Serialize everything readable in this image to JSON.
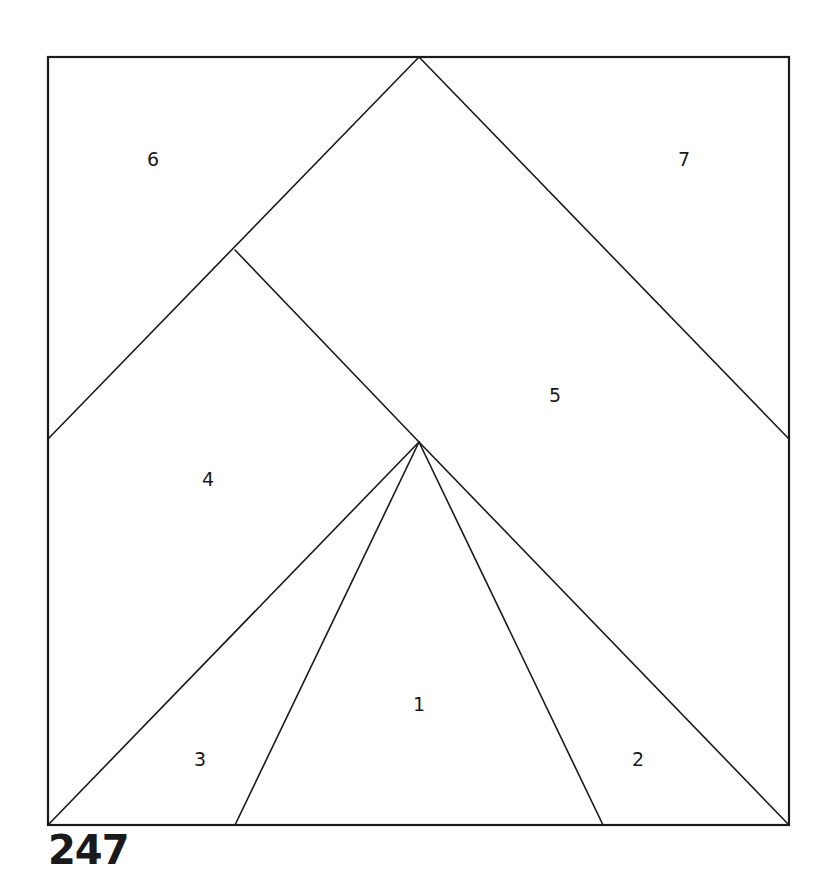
{
  "block": {
    "number": "247",
    "outline": {
      "x1": 48,
      "y1": 57,
      "x2": 789,
      "y2": 825
    }
  },
  "vertices": {
    "apex": [
      419,
      57
    ],
    "center": [
      419,
      442
    ],
    "left_mid": [
      48,
      439
    ],
    "right_mid": [
      789,
      439
    ],
    "left_junction": [
      235,
      250
    ],
    "bottom_left": [
      48,
      825
    ],
    "bottom_right": [
      789,
      825
    ],
    "bottom_inner_left": [
      235,
      825
    ],
    "bottom_inner_right": [
      603,
      825
    ]
  },
  "sections": [
    {
      "id": "1",
      "label": "1",
      "x": 419,
      "y": 704
    },
    {
      "id": "2",
      "label": "2",
      "x": 638,
      "y": 759
    },
    {
      "id": "3",
      "label": "3",
      "x": 200,
      "y": 759
    },
    {
      "id": "4",
      "label": "4",
      "x": 208,
      "y": 479
    },
    {
      "id": "5",
      "label": "5",
      "x": 555,
      "y": 395
    },
    {
      "id": "6",
      "label": "6",
      "x": 153,
      "y": 159
    },
    {
      "id": "7",
      "label": "7",
      "x": 684,
      "y": 159
    }
  ],
  "colors": {
    "line": "#1a1a1a",
    "background": "#ffffff"
  }
}
